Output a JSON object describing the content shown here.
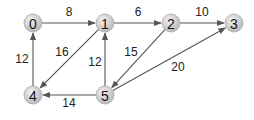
{
  "colors": {
    "node_fill_light": "#eeeeee",
    "node_fill_dark": "#b8b8b8",
    "node_stroke": "#a8a8a8",
    "edge": "#555555",
    "text": "#222222"
  },
  "graph": {
    "directed": true,
    "nodes": [
      {
        "id": "0",
        "label": "0",
        "x": 33,
        "y": 23
      },
      {
        "id": "1",
        "label": "1",
        "x": 105,
        "y": 23
      },
      {
        "id": "2",
        "label": "2",
        "x": 171,
        "y": 23
      },
      {
        "id": "3",
        "label": "3",
        "x": 234,
        "y": 23
      },
      {
        "id": "4",
        "label": "4",
        "x": 33,
        "y": 95
      },
      {
        "id": "5",
        "label": "5",
        "x": 105,
        "y": 95
      }
    ],
    "edges": [
      {
        "from": "0",
        "to": "1",
        "weight": "8",
        "lx": 69,
        "ly": 12
      },
      {
        "from": "1",
        "to": "2",
        "weight": "6",
        "lx": 138,
        "ly": 12
      },
      {
        "from": "2",
        "to": "3",
        "weight": "10",
        "lx": 202,
        "ly": 12
      },
      {
        "from": "1",
        "to": "4",
        "weight": "16",
        "lx": 62,
        "ly": 52
      },
      {
        "from": "4",
        "to": "0",
        "weight": "12",
        "lx": 22,
        "ly": 59
      },
      {
        "from": "5",
        "to": "1",
        "weight": "12",
        "lx": 95,
        "ly": 62
      },
      {
        "from": "2",
        "to": "5",
        "weight": "15",
        "lx": 131,
        "ly": 52
      },
      {
        "from": "5",
        "to": "3",
        "weight": "20",
        "lx": 178,
        "ly": 67
      },
      {
        "from": "5",
        "to": "4",
        "weight": "14",
        "lx": 69,
        "ly": 103
      }
    ]
  }
}
